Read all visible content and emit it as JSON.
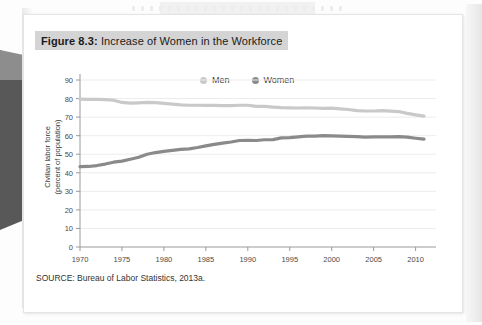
{
  "figure": {
    "label": "Figure 8.3:",
    "title": " Increase of Women in the Workforce",
    "full_title": "Figure 8.3: Increase of Women in the Workforce",
    "source": "SOURCE: Bureau of Labor Statistics, 2013a."
  },
  "colors": {
    "men_line": "#c9c9c9",
    "women_line": "#8a8a8a",
    "gridline": "#ececec",
    "axis": "#9a9a9a",
    "title_band": "#d4d4d4",
    "card_bg": "#ffffff",
    "text": "#333333"
  },
  "legend": {
    "position": "top-center",
    "items": [
      {
        "label": "Men",
        "color": "#c9c9c9"
      },
      {
        "label": "Women",
        "color": "#8a8a8a"
      }
    ]
  },
  "chart_data": {
    "type": "line",
    "title": "Figure 8.3: Increase of Women in the Workforce",
    "xlabel": "",
    "ylabel": "Civilian labor force\n(percent of population)",
    "ylabel_line1": "Civilian labor force",
    "ylabel_line2": "(percent of population)",
    "xlim": [
      1970,
      2011
    ],
    "ylim": [
      0,
      90
    ],
    "ytick_step": 10,
    "yticks": [
      0,
      10,
      20,
      30,
      40,
      50,
      60,
      70,
      80,
      90
    ],
    "xticks": [
      1970,
      1975,
      1980,
      1985,
      1990,
      1995,
      2000,
      2005,
      2010
    ],
    "grid": true,
    "grid_axis": "y",
    "x": [
      1970,
      1971,
      1972,
      1973,
      1974,
      1975,
      1976,
      1977,
      1978,
      1979,
      1980,
      1981,
      1982,
      1983,
      1984,
      1985,
      1986,
      1987,
      1988,
      1989,
      1990,
      1991,
      1992,
      1993,
      1994,
      1995,
      1996,
      1997,
      1998,
      1999,
      2000,
      2001,
      2002,
      2003,
      2004,
      2005,
      2006,
      2007,
      2008,
      2009,
      2010,
      2011
    ],
    "series": [
      {
        "name": "Men",
        "color": "#c9c9c9",
        "values": [
          79.7,
          79.6,
          79.6,
          79.4,
          79.1,
          77.9,
          77.5,
          77.7,
          77.9,
          77.8,
          77.4,
          77.0,
          76.6,
          76.4,
          76.4,
          76.3,
          76.3,
          76.2,
          76.2,
          76.4,
          76.4,
          75.8,
          75.8,
          75.4,
          75.1,
          75.0,
          74.9,
          75.0,
          74.9,
          74.7,
          74.8,
          74.4,
          74.1,
          73.5,
          73.3,
          73.3,
          73.5,
          73.2,
          73.0,
          72.0,
          71.2,
          70.5
        ]
      },
      {
        "name": "Women",
        "color": "#8a8a8a",
        "values": [
          43.3,
          43.4,
          43.9,
          44.7,
          45.7,
          46.3,
          47.3,
          48.4,
          50.0,
          50.9,
          51.5,
          52.1,
          52.6,
          52.9,
          53.6,
          54.5,
          55.3,
          56.0,
          56.6,
          57.4,
          57.5,
          57.4,
          57.8,
          57.9,
          58.8,
          58.9,
          59.3,
          59.8,
          59.8,
          60.0,
          59.9,
          59.8,
          59.6,
          59.5,
          59.2,
          59.3,
          59.4,
          59.3,
          59.5,
          59.2,
          58.6,
          58.1
        ]
      }
    ]
  }
}
